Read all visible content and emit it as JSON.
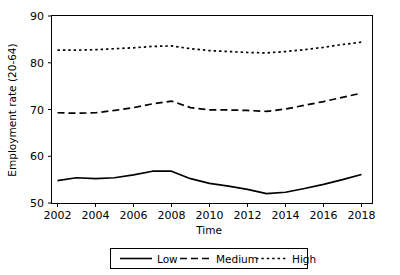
{
  "chart_data": {
    "type": "line",
    "title": "",
    "xlabel": "Time",
    "ylabel": "Employment rate (20-64)",
    "xlim": [
      2002,
      2018
    ],
    "ylim": [
      50,
      90
    ],
    "grid": false,
    "legend_position": "bottom",
    "x": [
      2002,
      2003,
      2004,
      2005,
      2006,
      2007,
      2008,
      2009,
      2010,
      2011,
      2012,
      2013,
      2014,
      2015,
      2016,
      2017,
      2018
    ],
    "xticks": [
      2002,
      2004,
      2006,
      2008,
      2010,
      2012,
      2014,
      2016,
      2018
    ],
    "xtick_labels": [
      "2002",
      "2004",
      "2006",
      "2008",
      "2010",
      "2012",
      "2014",
      "2016",
      "2018"
    ],
    "yticks": [
      50,
      60,
      70,
      80,
      90
    ],
    "ytick_labels": [
      "50",
      "60",
      "70",
      "80",
      "90"
    ],
    "series": [
      {
        "name": "Low",
        "style": "solid",
        "color": "#000000",
        "values": [
          54.8,
          55.4,
          55.2,
          55.4,
          56.0,
          56.8,
          56.8,
          55.2,
          54.2,
          53.6,
          52.9,
          52.0,
          52.3,
          53.1,
          54.0,
          55.0,
          56.1
        ]
      },
      {
        "name": "Medium",
        "style": "dashed",
        "color": "#000000",
        "values": [
          69.3,
          69.2,
          69.3,
          69.8,
          70.4,
          71.2,
          71.8,
          70.4,
          69.9,
          69.9,
          69.8,
          69.6,
          70.1,
          70.9,
          71.7,
          72.6,
          73.5
        ]
      },
      {
        "name": "High",
        "style": "dotted",
        "color": "#000000",
        "values": [
          82.7,
          82.7,
          82.8,
          83.0,
          83.2,
          83.5,
          83.6,
          83.0,
          82.6,
          82.4,
          82.2,
          82.1,
          82.4,
          82.8,
          83.3,
          83.9,
          84.4
        ]
      }
    ]
  },
  "legend": {
    "items": [
      {
        "label": "Low",
        "style": "solid"
      },
      {
        "label": "Medium",
        "style": "dashed"
      },
      {
        "label": "High",
        "style": "dotted"
      }
    ]
  }
}
